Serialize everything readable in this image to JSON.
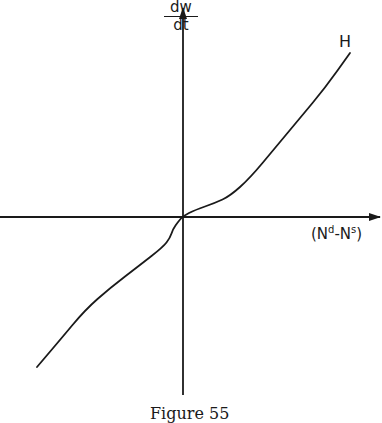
{
  "figure": {
    "caption": "Figure 55",
    "y_axis": {
      "numerator": "dw",
      "denominator": "dt"
    },
    "x_axis": {
      "open": "(N",
      "sup1": "d",
      "dash": "-N",
      "sup2": "s",
      "close": ")"
    },
    "curve_label": "H",
    "colors": {
      "ink": "#1a1a1a",
      "background": "#ffffff"
    }
  },
  "chart_data": {
    "type": "line",
    "title": "",
    "caption": "Figure 55",
    "xlabel": "(N^d - N^s)",
    "ylabel": "dw/dt",
    "series": [
      {
        "name": "H",
        "description": "Monotonically increasing curve through the origin; steeper in the upper-right quadrant, with a kink just below the origin",
        "points_px": [
          [
            37,
            367
          ],
          [
            60,
            340
          ],
          [
            85,
            310
          ],
          [
            110,
            288
          ],
          [
            140,
            265
          ],
          [
            163,
            247
          ],
          [
            170,
            238
          ],
          [
            173,
            229
          ],
          [
            178,
            222
          ],
          [
            183,
            216
          ],
          [
            195,
            210
          ],
          [
            215,
            203
          ],
          [
            230,
            196
          ],
          [
            250,
            178
          ],
          [
            275,
            148
          ],
          [
            300,
            118
          ],
          [
            325,
            88
          ],
          [
            350,
            53
          ]
        ]
      }
    ],
    "axes_origin_px": [
      183,
      217
    ],
    "grid": false,
    "legend": "none (curve labelled H at upper-right end)"
  }
}
